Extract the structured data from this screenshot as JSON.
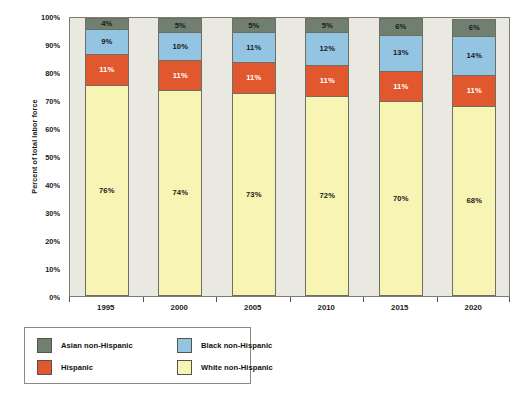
{
  "chart_data": {
    "type": "bar",
    "subtype": "stacked-percent",
    "title": "",
    "xlabel": "",
    "ylabel": "Percent of total labor force",
    "ylim": [
      0,
      100
    ],
    "ytick_labels": [
      "0%",
      "10%",
      "20%",
      "30%",
      "40%",
      "50%",
      "60%",
      "70%",
      "80%",
      "90%",
      "100%"
    ],
    "ytick_values": [
      0,
      10,
      20,
      30,
      40,
      50,
      60,
      70,
      80,
      90,
      100
    ],
    "grid": false,
    "legend_position": "bottom-left",
    "categories": [
      "1995",
      "2000",
      "2005",
      "2010",
      "2015",
      "2020"
    ],
    "series": [
      {
        "name": "White non-Hispanic",
        "color": "#f7f4b4",
        "label_color": "#1a1a1a",
        "values": [
          76,
          74,
          73,
          72,
          70,
          68
        ],
        "labels": [
          "76%",
          "74%",
          "73%",
          "72%",
          "70%",
          "68%"
        ]
      },
      {
        "name": "Hispanic",
        "color": "#e2582e",
        "label_color": "#ffffff",
        "values": [
          11,
          11,
          11,
          11,
          11,
          11
        ],
        "labels": [
          "11%",
          "11%",
          "11%",
          "11%",
          "11%",
          "11%"
        ]
      },
      {
        "name": "Black non-Hispanic",
        "color": "#93c4e2",
        "label_color": "#1a1a1a",
        "values": [
          9,
          10,
          11,
          12,
          13,
          14
        ],
        "labels": [
          "9%",
          "10%",
          "11%",
          "12%",
          "13%",
          "14%"
        ]
      },
      {
        "name": "Asian non-Hispanic",
        "color": "#707f70",
        "label_color": "#1a1a1a",
        "values": [
          4,
          5,
          5,
          5,
          6,
          6
        ],
        "labels": [
          "4%",
          "5%",
          "5%",
          "5%",
          "6%",
          "6%"
        ]
      }
    ]
  },
  "legend": {
    "items": [
      {
        "label": "Asian non-Hispanic",
        "color": "#707f70"
      },
      {
        "label": "Black non-Hispanic",
        "color": "#93c4e2"
      },
      {
        "label": "Hispanic",
        "color": "#e2582e"
      },
      {
        "label": "White non-Hispanic",
        "color": "#f7f4b4"
      }
    ]
  }
}
